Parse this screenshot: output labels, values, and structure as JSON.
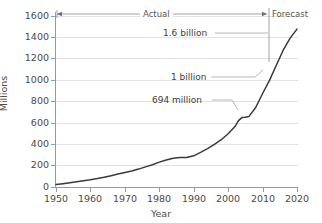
{
  "chart_data": {
    "type": "line",
    "title": "",
    "xlabel": "Year",
    "ylabel": "Millions",
    "xlim": [
      1950,
      2020
    ],
    "ylim": [
      0,
      1700
    ],
    "grid": true,
    "legend_position": "none",
    "x_ticks": [
      "1950",
      "1960",
      "1970",
      "1980",
      "1990",
      "2000",
      "2010",
      "2020"
    ],
    "y_ticks": [
      "0",
      "200",
      "400",
      "600",
      "800",
      "1000",
      "1200",
      "1400",
      "1600"
    ],
    "series": [
      {
        "name": "Total",
        "x": [
          1950,
          1952,
          1954,
          1956,
          1958,
          1960,
          1962,
          1964,
          1966,
          1968,
          1970,
          1972,
          1974,
          1976,
          1978,
          1980,
          1982,
          1984,
          1986,
          1988,
          1990,
          1992,
          1994,
          1996,
          1998,
          2000,
          2002,
          2003,
          2004,
          2005,
          2006,
          2008,
          2010,
          2012,
          2014,
          2016,
          2018,
          2020
        ],
        "values": [
          25,
          33,
          42,
          52,
          62,
          72,
          84,
          97,
          112,
          128,
          145,
          160,
          178,
          200,
          222,
          248,
          268,
          285,
          292,
          293,
          310,
          345,
          382,
          425,
          470,
          530,
          600,
          660,
          690,
          694,
          700,
          790,
          930,
          1060,
          1210,
          1360,
          1480,
          1570
        ]
      }
    ],
    "annotations": [
      {
        "label": "1.6 billion",
        "value": 1600,
        "year": 2020
      },
      {
        "label": "1 billion",
        "value": 1000,
        "year": 2011
      },
      {
        "label": "694 million",
        "value": 694,
        "year": 2005
      }
    ],
    "spans": [
      {
        "label": "Actual",
        "start": 1950,
        "end": 2016
      },
      {
        "label": "Forecast",
        "start": 2016,
        "end": 2020
      }
    ],
    "line_color": "#3a3a3a",
    "grid_color": "#e2e2e2",
    "axis_color": "#9a9a9a",
    "text_color": "#4a4a4a"
  }
}
